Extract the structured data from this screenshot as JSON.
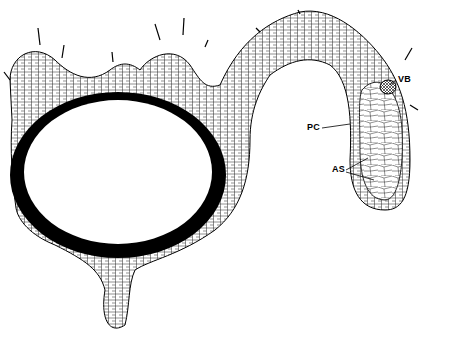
{
  "diagram": {
    "labels": [
      {
        "id": "vb",
        "text": "VB",
        "x": 398,
        "y": 78
      },
      {
        "id": "pc",
        "text": "PC",
        "x": 307,
        "y": 126
      },
      {
        "id": "as",
        "text": "AS",
        "x": 332,
        "y": 168
      }
    ],
    "colors": {
      "line": "#000000",
      "fill": "#ffffff",
      "dense": "#000000"
    }
  }
}
